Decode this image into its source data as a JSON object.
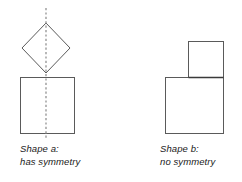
{
  "figure": {
    "background_color": "#ffffff",
    "stroke_color": "#5a5a5a",
    "symmetry_line_color": "#9a9a9a",
    "text_color": "#1a1a1a"
  },
  "shapes": {
    "a": {
      "label_line1": "Shape a:",
      "label_line2": "has symmetry",
      "has_symmetry": true,
      "symmetry_axis": "vertical",
      "parts": [
        {
          "name": "diamond",
          "type": "rhombus",
          "points": "46,23 70,48 46,73 22,48"
        },
        {
          "name": "square",
          "type": "rect",
          "x": 20,
          "y": 77,
          "width": 54,
          "height": 56
        }
      ],
      "symmetry_line": {
        "x": 46,
        "y1": 8,
        "y2": 140
      }
    },
    "b": {
      "label_line1": "Shape b:",
      "label_line2": "no symmetry",
      "has_symmetry": false,
      "symmetry_axis": "none",
      "parts": [
        {
          "name": "small-square",
          "type": "rect",
          "x": 188,
          "y": 41,
          "width": 35,
          "height": 36
        },
        {
          "name": "large-square",
          "type": "rect",
          "x": 165,
          "y": 77,
          "width": 58,
          "height": 56
        }
      ]
    }
  }
}
